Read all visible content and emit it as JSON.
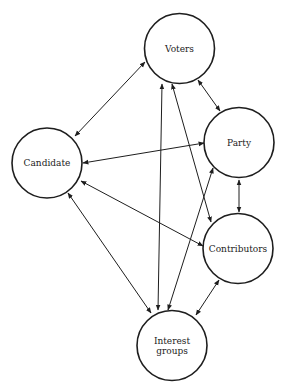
{
  "diagram": {
    "type": "network",
    "stroke_color": "#1e1e1e",
    "background": "#ffffff",
    "nodes": [
      {
        "id": "voters",
        "label_lines": [
          "Voters"
        ],
        "cx": 179.5,
        "cy": 48.5,
        "r": 35
      },
      {
        "id": "candidate",
        "label_lines": [
          "Candidate"
        ],
        "cx": 47,
        "cy": 163,
        "r": 35
      },
      {
        "id": "party",
        "label_lines": [
          "Party"
        ],
        "cx": 239,
        "cy": 142.5,
        "r": 35
      },
      {
        "id": "contributors",
        "label_lines": [
          "Contributors"
        ],
        "cx": 238,
        "cy": 248.5,
        "r": 35
      },
      {
        "id": "interest_groups",
        "label_lines": [
          "Interest",
          "groups"
        ],
        "cx": 172,
        "cy": 345.5,
        "r": 35
      }
    ],
    "edges": [
      {
        "from": "candidate",
        "to": "voters",
        "x1": 75,
        "y1": 136,
        "x2": 145,
        "y2": 62,
        "directed": "both"
      },
      {
        "from": "voters",
        "to": "party",
        "x1": 198,
        "y1": 80,
        "x2": 220,
        "y2": 111,
        "directed": "both"
      },
      {
        "from": "candidate",
        "to": "party",
        "x1": 83,
        "y1": 163,
        "x2": 204,
        "y2": 143,
        "directed": "both"
      },
      {
        "from": "voters",
        "to": "interest_groups",
        "x1": 162,
        "y1": 84,
        "x2": 158,
        "y2": 310,
        "directed": "both"
      },
      {
        "from": "voters",
        "to": "contributors",
        "x1": 172,
        "y1": 84,
        "x2": 211,
        "y2": 222,
        "directed": "both"
      },
      {
        "from": "party",
        "to": "interest_groups",
        "x1": 213,
        "y1": 168,
        "x2": 168,
        "y2": 310,
        "directed": "both"
      },
      {
        "from": "candidate",
        "to": "contributors",
        "x1": 81,
        "y1": 181,
        "x2": 203,
        "y2": 246,
        "directed": "both"
      },
      {
        "from": "party",
        "to": "contributors",
        "x1": 239,
        "y1": 180,
        "x2": 239,
        "y2": 212,
        "directed": "both"
      },
      {
        "from": "candidate",
        "to": "interest_groups",
        "x1": 68,
        "y1": 193,
        "x2": 151,
        "y2": 313,
        "directed": "both"
      },
      {
        "from": "contributors",
        "to": "interest_groups",
        "x1": 219,
        "y1": 280,
        "x2": 196,
        "y2": 315,
        "directed": "both"
      }
    ]
  }
}
